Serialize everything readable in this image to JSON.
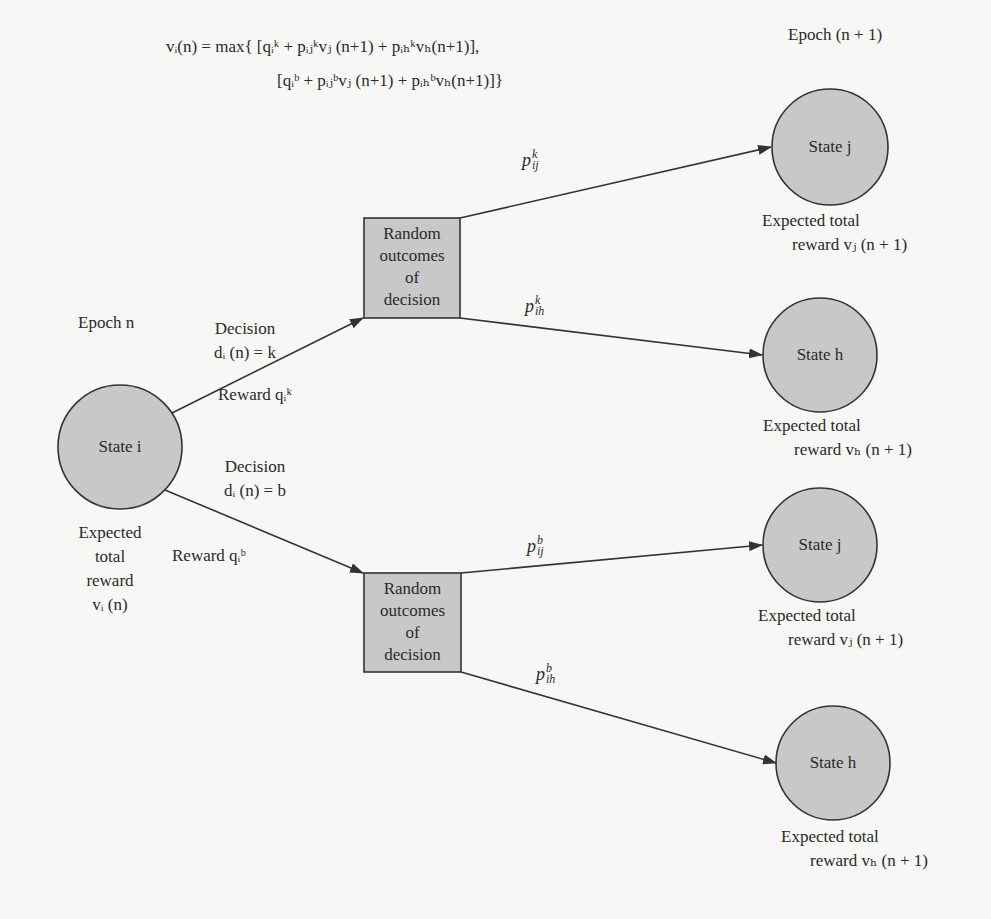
{
  "figure": {
    "type": "decision-tree-diagram",
    "colors": {
      "background": "#f7f7f5",
      "node_fill": "#c8c8c8",
      "stroke": "#333333",
      "text": "#2a2a2a"
    }
  },
  "equation": {
    "line1": "vᵢ(n) = max{ [qᵢᵏ + pᵢⱼᵏvⱼ (n+1) + pᵢₕᵏvₕ(n+1)],",
    "line2": "[qᵢᵇ + pᵢⱼᵇvⱼ (n+1) + pᵢₕᵇvₕ(n+1)]}"
  },
  "epochs": {
    "current": "Epoch n",
    "next": "Epoch (n + 1)"
  },
  "source_state": {
    "label": "State i",
    "reward_lines": [
      "Expected",
      "total",
      "reward",
      "vᵢ (n)"
    ]
  },
  "decisions": [
    {
      "id": "k",
      "title": "Decision",
      "formula": "dᵢ (n) = k",
      "reward": "Reward qᵢᵏ",
      "box_lines": [
        "Random",
        "outcomes",
        "of",
        "decision"
      ],
      "transitions": [
        {
          "prob": "pᵢⱼᵏ",
          "prob_base": "p",
          "prob_sub": "ij",
          "prob_sup": "k",
          "target": "State j",
          "reward_line1": "Expected total",
          "reward_line2": "reward vⱼ (n + 1)"
        },
        {
          "prob": "pᵢₕᵏ",
          "prob_base": "p",
          "prob_sub": "ih",
          "prob_sup": "k",
          "target": "State h",
          "reward_line1": "Expected total",
          "reward_line2": "reward vₕ (n + 1)"
        }
      ]
    },
    {
      "id": "b",
      "title": "Decision",
      "formula": "dᵢ (n) = b",
      "reward": "Reward qᵢᵇ",
      "box_lines": [
        "Random",
        "outcomes",
        "of",
        "decision"
      ],
      "transitions": [
        {
          "prob": "pᵢⱼᵇ",
          "prob_base": "p",
          "prob_sub": "ij",
          "prob_sup": "b",
          "target": "State j",
          "reward_line1": "Expected total",
          "reward_line2": "reward vⱼ (n + 1)"
        },
        {
          "prob": "pᵢₕᵇ",
          "prob_base": "p",
          "prob_sub": "ih",
          "prob_sup": "b",
          "target": "State h",
          "reward_line1": "Expected total",
          "reward_line2": "reward vₕ (n + 1)"
        }
      ]
    }
  ]
}
